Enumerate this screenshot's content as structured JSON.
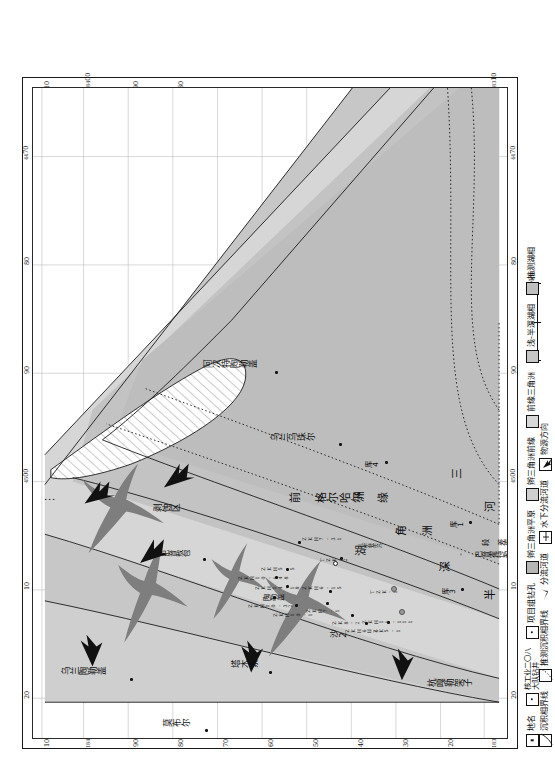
{
  "figure": {
    "type": "sedimentary-facies-map",
    "orientation": "landscape-art-rotated-90-on-portrait-page"
  },
  "axes": {
    "horizontal_ticks": [
      "20",
      "10",
      "45|00",
      "90",
      "80",
      "44|70"
    ],
    "horizontal_ticks_main": [
      "20",
      "10",
      "00",
      "90",
      "80",
      "70"
    ],
    "horizontal_ticks_prefix": [
      "",
      "",
      "45",
      "",
      "",
      "44"
    ],
    "vertical_ticks": [
      "183|10",
      "20",
      "30",
      "40",
      "50",
      "60",
      "70",
      "80",
      "90",
      "184|00",
      "10"
    ],
    "vertical_ticks_main": [
      "10",
      "20",
      "30",
      "40",
      "50",
      "60",
      "70",
      "80",
      "90",
      "00",
      "10"
    ],
    "vertical_ticks_prefix": [
      "183",
      "",
      "",
      "",
      "",
      "",
      "",
      "",
      "",
      "184",
      ""
    ]
  },
  "place_names": [
    {
      "name": "乌兰陶勒盖"
    },
    {
      "name": "莫布尔"
    },
    {
      "name": "塔木素"
    },
    {
      "name": "巴音敖包"
    },
    {
      "name": "剥蚀区"
    },
    {
      "name": "阿次特陶勒盖"
    },
    {
      "name": "乌兰乌珠尔"
    },
    {
      "name": "杭嘎勒架子"
    },
    {
      "name": "乌和尔乌苏"
    },
    {
      "name": "陶勒盖"
    },
    {
      "name": "库3"
    },
    {
      "name": "库4"
    },
    {
      "name": "沙2"
    },
    {
      "name": "库1"
    },
    {
      "name": "湖"
    },
    {
      "name": "孔尔特尔苏"
    }
  ],
  "facies_labels": {
    "front_delta_margin": "前  格尔哈尔  缘",
    "delta_front": "角  洲",
    "deep_semi_deep": "深",
    "half": "半",
    "river": "河",
    "shape": "状",
    "delta": "洲",
    "three": "三",
    "line_name": "- 巴音霍特勒 -",
    "line_name2": "段  差库尔图哈沙",
    "line_name3": "线"
  },
  "wells": [
    {
      "id": "ZKH10-32"
    },
    {
      "id": "ZKH10-1"
    },
    {
      "id": "ZKH14-18"
    },
    {
      "id": "ZKH10-148"
    },
    {
      "id": "ZKH5-5"
    },
    {
      "id": "ZKH6-15"
    },
    {
      "id": "ZKH7-1"
    },
    {
      "id": "ZK8-2"
    },
    {
      "id": "ZKH6-1"
    },
    {
      "id": "HZK5-1"
    },
    {
      "id": "ZKH11-111"
    },
    {
      "id": "TZK-1"
    },
    {
      "id": "TZK-2"
    },
    {
      "id": "ZKH7-31"
    }
  ],
  "scalebar": {
    "ticks": [
      "0",
      "5",
      "10km"
    ],
    "unit": "km"
  },
  "legend": {
    "items": [
      {
        "swatch": "point-square",
        "label": "地名"
      },
      {
        "swatch": "point-dot",
        "label": "核工业二〇八\n大队钻井",
        "line1": "核工业二〇八",
        "line2": "大队钻井"
      },
      {
        "swatch": "point-dot",
        "label": "项目组钻孔"
      },
      {
        "swatch": "fill-gray",
        "label": "辫三角洲平原"
      },
      {
        "swatch": "fill-gray2",
        "label": "辫三角洲前缘"
      },
      {
        "swatch": "fill-gray3",
        "label": "前缘三角洲"
      },
      {
        "swatch": "fill-gray4",
        "label": "浅-半深湖相"
      },
      {
        "swatch": "fill-gray5",
        "label": "推测湖相"
      },
      {
        "swatch": "line-solid",
        "label": "沉积相界线"
      },
      {
        "swatch": "line-dashed",
        "label": "推测沉积相界线"
      },
      {
        "swatch": "icon-channel",
        "label": "分流河道"
      },
      {
        "swatch": "icon-subchan",
        "label": "水下分流河道"
      },
      {
        "swatch": "icon-arrow",
        "label": "物源方向"
      }
    ]
  },
  "colors": {
    "facies_plain": "#c9c9c9",
    "facies_front": "#d8d8d8",
    "facies_predelta": "#c2c2c2",
    "facies_lake": "#d0d0d0",
    "facies_inferred": "#bdbdbd",
    "channel": "#7d7d7d",
    "erosion_hatch": "#ffffff",
    "line": "#1a1a1a",
    "grid": "#b9b9b9",
    "text": "#0d0d0d"
  }
}
